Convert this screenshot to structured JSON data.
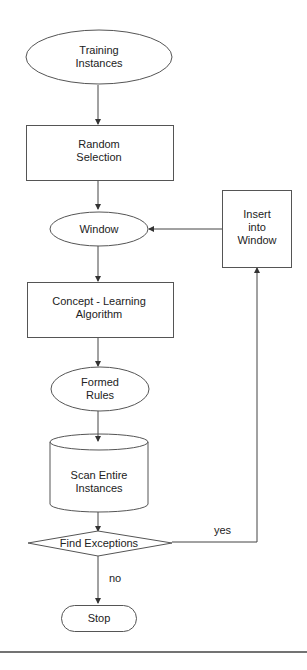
{
  "diagram": {
    "type": "flowchart",
    "nodes": {
      "training": {
        "shape": "ellipse",
        "line1": "Training",
        "line2": "Instances"
      },
      "random": {
        "shape": "rectangle",
        "line1": "Random",
        "line2": "Selection"
      },
      "window": {
        "shape": "ellipse",
        "line1": "Window"
      },
      "insert": {
        "shape": "rectangle",
        "line1": "Insert",
        "line2": "into",
        "line3": "Window"
      },
      "concept": {
        "shape": "rectangle",
        "line1": "Concept  -  Learning",
        "line2": "Algorithm"
      },
      "rules": {
        "shape": "ellipse",
        "line1": "Formed",
        "line2": "Rules"
      },
      "scan": {
        "shape": "cylinder",
        "line1": "Scan  Entire",
        "line2": "Instances"
      },
      "exceptions": {
        "shape": "diamond",
        "line1": "Find  Exceptions"
      },
      "stop": {
        "shape": "terminator",
        "line1": "Stop"
      }
    },
    "edges": [
      {
        "from": "training",
        "to": "random",
        "label": ""
      },
      {
        "from": "random",
        "to": "window",
        "label": ""
      },
      {
        "from": "window",
        "to": "concept",
        "label": ""
      },
      {
        "from": "concept",
        "to": "rules",
        "label": ""
      },
      {
        "from": "rules",
        "to": "scan",
        "label": ""
      },
      {
        "from": "scan",
        "to": "exceptions",
        "label": ""
      },
      {
        "from": "exceptions",
        "to": "insert",
        "label": "yes"
      },
      {
        "from": "exceptions",
        "to": "stop",
        "label": "no"
      },
      {
        "from": "insert",
        "to": "window",
        "label": ""
      }
    ],
    "edge_labels": {
      "yes": "yes",
      "no": "no"
    }
  }
}
